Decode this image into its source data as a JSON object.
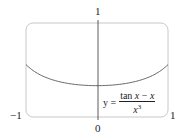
{
  "chart_data": {
    "type": "line",
    "title": "",
    "xlabel": "",
    "ylabel": "",
    "xlim": [
      -1,
      1
    ],
    "ylim": [
      0,
      1
    ],
    "x_tick_labels": [
      "-1",
      "0",
      "1"
    ],
    "y_tick_labels": [
      "1"
    ],
    "grid": false,
    "series": [
      {
        "name": "y = (tan x - x) / x^3",
        "function": "(tan(x) - x) / x^3",
        "x": [
          -1,
          -0.75,
          -0.5,
          -0.25,
          0,
          0.25,
          0.5,
          0.75,
          1
        ],
        "y": [
          0.557,
          0.451,
          0.37,
          0.342,
          0.333,
          0.342,
          0.37,
          0.451,
          0.557
        ]
      }
    ],
    "annotation": {
      "text": "y = (tan x − x) / x³",
      "position": "lower-right"
    }
  },
  "labels": {
    "y_top": "1",
    "x_left": "−1",
    "x_right": "1",
    "x_origin": "0",
    "eq_y": "y =",
    "eq_num_tan": "tan",
    "eq_num_x1": "x",
    "eq_num_minus": "−",
    "eq_num_x2": "x",
    "eq_den_x": "x",
    "eq_den_exp": "3"
  },
  "colors": {
    "frame": "#c8c8c8",
    "axis": "#333333",
    "curve": "#555555",
    "text": "#222222"
  }
}
